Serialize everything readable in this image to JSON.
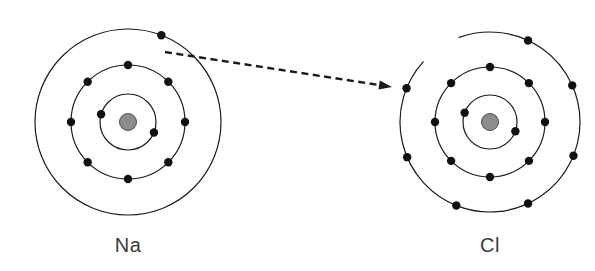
{
  "diagram": {
    "background_color": "#ffffff",
    "stroke_color": "#1a1a1a",
    "nucleus_fill": "#8c8c8c",
    "nucleus_stroke": "#4d4d4d",
    "electron_color": "#111111",
    "label_color": "#3a3a3a",
    "shell_stroke_width": 1.2,
    "electron_radius": 4.2
  },
  "atoms": [
    {
      "id": "sodium",
      "label": "Na",
      "symbol": "Na",
      "center_x": 128,
      "center_y": 122,
      "label_x": 128,
      "label_y": 252,
      "nucleus_radius": 8.5,
      "shells": [
        {
          "name": "inner-shell",
          "radius": 28,
          "electron_count": 2,
          "electron_angles": [
            196,
            22
          ]
        },
        {
          "name": "middle-shell",
          "radius": 57,
          "electron_count": 8,
          "electron_angles": [
            -90,
            -45,
            0,
            45,
            90,
            135,
            180,
            225
          ]
        },
        {
          "name": "outer-shell",
          "radius": 93,
          "electron_count": 1,
          "electron_angles": [
            -69
          ]
        }
      ]
    },
    {
      "id": "chlorine",
      "label": "Cl",
      "symbol": "Cl",
      "center_x": 490,
      "center_y": 122,
      "label_x": 490,
      "label_y": 252,
      "nucleus_radius": 8.5,
      "shells": [
        {
          "name": "inner-shell",
          "radius": 27,
          "electron_count": 2,
          "electron_angles": [
            200,
            20
          ]
        },
        {
          "name": "middle-shell",
          "radius": 55,
          "electron_count": 8,
          "electron_angles": [
            -90,
            -45,
            0,
            45,
            90,
            135,
            180,
            225
          ]
        },
        {
          "name": "outer-shell",
          "radius": 90,
          "electron_count": 7,
          "electron_angles": [
            -65,
            -24,
            22,
            65,
            112,
            157,
            202
          ],
          "gap_start_angle": 222,
          "gap_end_angle": 250
        }
      ]
    }
  ],
  "transfer_arrow": {
    "name": "electron-transfer-arrow",
    "start_x": 165,
    "start_y": 52,
    "end_x": 392,
    "end_y": 87,
    "stroke_color": "#1a1a1a",
    "stroke_width": 2.4,
    "dash_pattern": "7,4.5",
    "arrowhead_length": 13,
    "arrowhead_width": 9
  }
}
